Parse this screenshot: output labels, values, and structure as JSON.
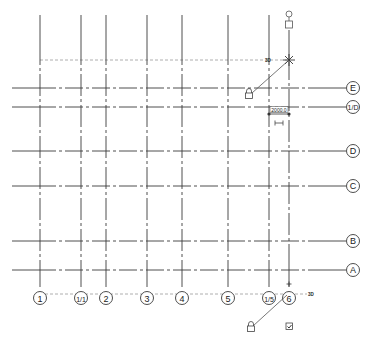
{
  "drawing": {
    "line_color": "#3a3a3a",
    "extent_color": "#9a9a9a",
    "background": "#ffffff",
    "vertical_grids": [
      {
        "label": "1",
        "x": 40
      },
      {
        "label": "1/1",
        "x": 81
      },
      {
        "label": "2",
        "x": 106
      },
      {
        "label": "3",
        "x": 147
      },
      {
        "label": "4",
        "x": 182
      },
      {
        "label": "5",
        "x": 228
      },
      {
        "label": "1/5",
        "x": 269
      },
      {
        "label": "6",
        "x": 289
      }
    ],
    "horizontal_grids": [
      {
        "label": "E",
        "y": 88
      },
      {
        "label": "1/D",
        "y": 107
      },
      {
        "label": "D",
        "y": 151
      },
      {
        "label": "C",
        "y": 186
      },
      {
        "label": "B",
        "y": 241
      },
      {
        "label": "A",
        "y": 270
      }
    ],
    "dimension": {
      "value": "2000.0"
    },
    "tags": {
      "top_3d": "3D",
      "bottom_3d": "3D"
    },
    "icons": {
      "lock_top": "lock-icon",
      "lock_bottom": "lock-icon",
      "checkbox_bottom": "checkbox-checked-icon",
      "elbow_toggle": "square-icon",
      "drag_handle_top": "circle-handle-icon",
      "pin": "pin-icon"
    }
  }
}
